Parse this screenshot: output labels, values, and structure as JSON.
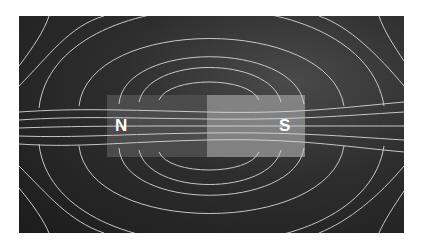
{
  "figure": {
    "magnet": {
      "north_label": "N",
      "south_label": "S",
      "north_color": "#4f4f4f",
      "south_color": "#8a8a8a"
    },
    "field_line_color": "#d8d8d8",
    "background_color": "#2a2a2a"
  }
}
